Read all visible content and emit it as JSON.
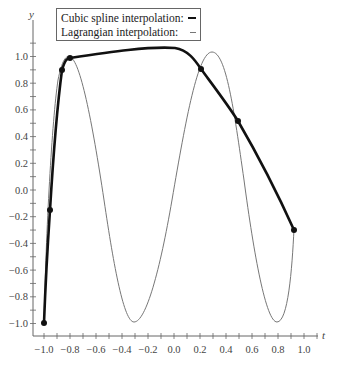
{
  "chart_data": {
    "type": "line",
    "title": "",
    "xlabel": "t",
    "ylabel": "y",
    "xlim": [
      -1.05,
      1.1
    ],
    "ylim": [
      -1.1,
      1.15
    ],
    "x_ticks": [
      "-1.0",
      "-0.8",
      "-0.6",
      "-0.4",
      "-0.2",
      "0.0",
      "0.2",
      "0.4",
      "0.6",
      "0.8",
      "1.0"
    ],
    "y_ticks": [
      "-1.0",
      "-0.8",
      "-0.6",
      "-0.4",
      "-0.2",
      "0.0",
      "0.2",
      "0.4",
      "0.6",
      "0.8",
      "1.0"
    ],
    "grid": false,
    "legend_position": "top-left",
    "series": [
      {
        "name": "Cubic spline interpolation:",
        "style": "thick black",
        "knots": [
          {
            "t": -1.0,
            "y": -1.0
          },
          {
            "t": -0.96,
            "y": -0.15
          },
          {
            "t": -0.87,
            "y": 0.9
          },
          {
            "t": -0.81,
            "y": 0.99
          },
          {
            "t": 0.2,
            "y": 0.9
          },
          {
            "t": 0.5,
            "y": 0.5
          },
          {
            "t": 0.92,
            "y": -0.3
          }
        ]
      },
      {
        "name": "Lagrangian interpolation:",
        "style": "thin gray",
        "approx_extrema": [
          {
            "t": -0.81,
            "y": 1.0
          },
          {
            "t": -0.32,
            "y": -1.0
          },
          {
            "t": 0.3,
            "y": 1.02
          },
          {
            "t": 0.79,
            "y": -1.0
          }
        ]
      }
    ]
  },
  "legend": {
    "items": [
      {
        "label": "Cubic spline interpolation:"
      },
      {
        "label": "Lagrangian interpolation:"
      }
    ]
  },
  "axes": {
    "x_label": "t",
    "y_label": "y"
  }
}
